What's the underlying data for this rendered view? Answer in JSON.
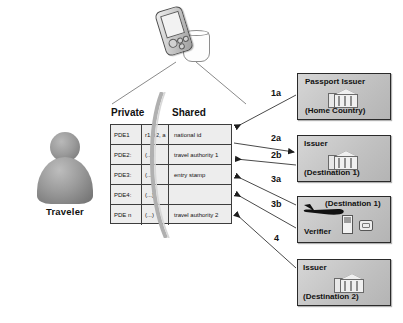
{
  "diagram": {
    "actor": {
      "label": "Traveler",
      "icon": "person-silhouette-icon"
    },
    "device": {
      "icon": "pda-device-icon",
      "cradle_icon": "device-cradle-icon"
    }
  },
  "table": {
    "headers": {
      "private": "Private",
      "shared": "Shared"
    },
    "rows": [
      {
        "pde": "PDE1",
        "attrs": "r1, r2, a",
        "shared": "national id"
      },
      {
        "pde": "PDE2:",
        "attrs": "(...)",
        "shared": "travel authority 1"
      },
      {
        "pde": "PDE3:",
        "attrs": "(...)",
        "shared": "entry stamp"
      },
      {
        "pde": "PDE4:",
        "attrs": "(...)",
        "shared": ""
      },
      {
        "pde": "PDE n",
        "attrs": "(...)",
        "shared": "travel authority 2"
      }
    ]
  },
  "entities": [
    {
      "id": "passport-issuer",
      "title": "Passport Issuer",
      "subtitle": "(Home Country)",
      "icon": "bank-building-icon"
    },
    {
      "id": "issuer-destination-1",
      "title": "Issuer",
      "subtitle": "(Destination 1)",
      "icon": "bank-building-icon"
    },
    {
      "id": "verifier-destination-1",
      "title": "Verifier",
      "subtitle": "(Destination 1)",
      "icon": "airplane-icon"
    },
    {
      "id": "issuer-destination-2",
      "title": "Issuer",
      "subtitle": "(Destination 2)",
      "icon": "bank-building-icon"
    }
  ],
  "flows": [
    {
      "label": "1a",
      "from": "passport-issuer",
      "to": "table",
      "direction": "left"
    },
    {
      "label": "2a",
      "from": "table",
      "to": "issuer-destination-1",
      "direction": "right"
    },
    {
      "label": "2b",
      "from": "issuer-destination-1",
      "to": "table",
      "direction": "left"
    },
    {
      "label": "3a",
      "from": "table",
      "to": "verifier-destination-1",
      "direction": "right"
    },
    {
      "label": "3b",
      "from": "verifier-destination-1",
      "to": "table",
      "direction": "left"
    },
    {
      "label": "4",
      "from": "issuer-destination-2",
      "to": "table",
      "direction": "left"
    }
  ],
  "colors": {
    "box_fill": "#c6c6c6",
    "box_border": "#2a2a2a",
    "table_fill": "#ededed",
    "line": "#5a5a5a",
    "text": "#111111"
  }
}
